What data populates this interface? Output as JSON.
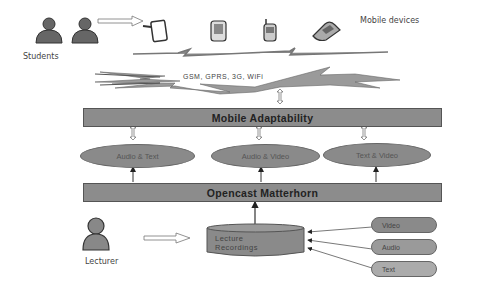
{
  "top": {
    "students_label": "Students",
    "mobile_devices_label": "Mobile devices",
    "devices": [
      "tablet-icon",
      "pda-icon",
      "cellphone-icon",
      "flip-phone-icon"
    ]
  },
  "network": {
    "label": "GSM, GPRS, 3G, WiFi"
  },
  "mobile_adaptability": {
    "label": "Mobile Adaptability"
  },
  "formats": [
    {
      "label": "Audio & Text"
    },
    {
      "label": "Audio & Video"
    },
    {
      "label": "Text & Video"
    }
  ],
  "matterhorn": {
    "label": "Opencast Matterhorn"
  },
  "lecturer": {
    "label": "Lecturer"
  },
  "recordings": {
    "line1": "Lecture",
    "line2": "Recordings"
  },
  "sources": [
    {
      "label": "Video",
      "color": "#8a8a8a"
    },
    {
      "label": "Audio",
      "color": "#9a9a9a"
    },
    {
      "label": "Text",
      "color": "#ababab"
    }
  ],
  "colors": {
    "box_fill": "#8c8c8c",
    "border": "#555555",
    "ellipse_fill": "#8a8a8a"
  }
}
